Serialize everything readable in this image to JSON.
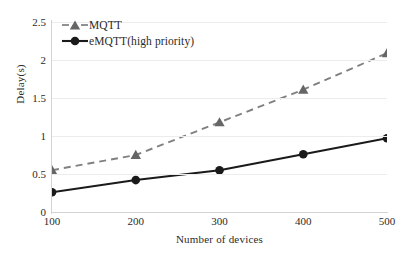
{
  "chart_data": {
    "type": "line",
    "title": "",
    "xlabel": "Number of devices",
    "ylabel": "Delay(s)",
    "x": [
      100,
      200,
      300,
      400,
      500
    ],
    "xticklabels": [
      "100",
      "200",
      "300",
      "400",
      "500"
    ],
    "yticklabels": [
      "0",
      "0.5",
      "1",
      "1.5",
      "2",
      "2.5"
    ],
    "yticks": [
      0,
      0.5,
      1,
      1.5,
      2,
      2.5
    ],
    "xlim": [
      100,
      500
    ],
    "ylim": [
      0,
      2.5
    ],
    "grid": "horizontal",
    "legend_position": "upper-left",
    "series": [
      {
        "name": "MQTT",
        "values": [
          0.55,
          0.75,
          1.18,
          1.61,
          2.09
        ],
        "color": "#808080",
        "linestyle": "dashed",
        "marker": "triangle"
      },
      {
        "name": "eMQTT(high priority)",
        "values": [
          0.26,
          0.42,
          0.55,
          0.76,
          0.97
        ],
        "color": "#1a1a1a",
        "linestyle": "solid",
        "marker": "circle"
      }
    ]
  }
}
